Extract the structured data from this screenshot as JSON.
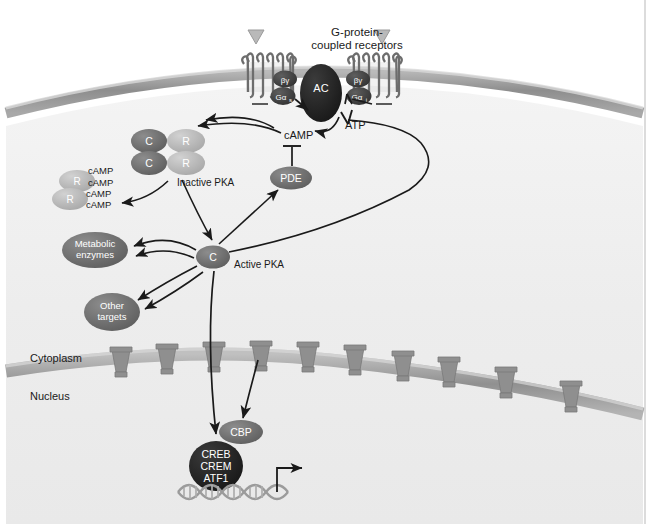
{
  "figure": {
    "background_color": "#ffffff",
    "cell_fill": "#efefef",
    "membrane_color": "#9a9a9a",
    "dark_protein_color": "#3d3d3d",
    "mid_protein_color": "#6f6f6f",
    "light_protein_color": "#b8b8b8",
    "line_color": "#1a1a1a",
    "text_color": "#1a1a1a",
    "label_on_dark_color": "#ffffff"
  },
  "header": {
    "receptor_title_line1": "G-protein-",
    "receptor_title_line2": "coupled receptors"
  },
  "ligands": [
    {
      "name": "ligand-left",
      "label": ""
    },
    {
      "name": "ligand-right",
      "label": ""
    }
  ],
  "receptors": [
    {
      "id": "receptor-left",
      "helix_count": 7,
      "g_protein": {
        "betagamma": "βγ",
        "alpha": "Gα",
        "alpha_sub": "s"
      }
    },
    {
      "id": "receptor-right",
      "helix_count": 7,
      "g_protein": {
        "betagamma": "βγ",
        "alpha": "Gα",
        "alpha_sub": "i"
      }
    }
  ],
  "enzymes": {
    "adenylyl_cyclase": {
      "label": "AC",
      "name": "adenylyl-cyclase"
    },
    "phosphodiesterase": {
      "label": "PDE",
      "name": "phosphodiesterase"
    }
  },
  "metabolites": {
    "atp": "ATP",
    "camp": "cAMP"
  },
  "pka": {
    "inactive_label": "Inactive PKA",
    "active_label": "Active PKA",
    "catalytic_subunit": "C",
    "regulatory_subunit": "R",
    "camp_bound_label": "cAMP",
    "camp_bound_count": 4
  },
  "targets": [
    {
      "id": "metabolic-enzymes",
      "line1": "Metabolic",
      "line2": "enzymes"
    },
    {
      "id": "other-targets",
      "line1": "Other",
      "line2": "targets"
    }
  ],
  "compartments": {
    "cytoplasm": "Cytoplasm",
    "nucleus": "Nucleus"
  },
  "nucleus": {
    "coactivator": {
      "label": "CBP",
      "name": "cbp-coactivator"
    },
    "transcription_factor": {
      "name": "creb-crem-atf1",
      "line1": "CREB",
      "line2": "CREM",
      "line3": "ATF1"
    },
    "dna": {
      "name": "dna-double-helix",
      "turns": 4
    },
    "transcription_arrow": {
      "name": "transcription-start-arrow"
    }
  },
  "nuclear_pores": {
    "count": 10
  },
  "interactions": [
    {
      "from": "receptor-left-galphas",
      "to": "adenylyl-cyclase",
      "type": "activation"
    },
    {
      "from": "receptor-right-galphai",
      "to": "adenylyl-cyclase",
      "type": "inhibition"
    },
    {
      "from": "adenylyl-cyclase",
      "to": "camp",
      "type": "conversion",
      "substrate": "ATP"
    },
    {
      "from": "camp",
      "to": "inactive-pka",
      "type": "activation"
    },
    {
      "from": "camp",
      "to": "regulatory-subunits",
      "type": "binding"
    },
    {
      "from": "phosphodiesterase",
      "to": "camp",
      "type": "inhibition"
    },
    {
      "from": "active-pka",
      "to": "phosphodiesterase",
      "type": "activation"
    },
    {
      "from": "active-pka",
      "to": "metabolic-enzymes",
      "type": "activation"
    },
    {
      "from": "active-pka",
      "to": "other-targets",
      "type": "activation"
    },
    {
      "from": "active-pka",
      "to": "adenylyl-cyclase",
      "type": "inhibition"
    },
    {
      "from": "active-pka",
      "to": "creb-crem-atf1",
      "type": "activation"
    },
    {
      "from": "active-pka",
      "to": "cbp-coactivator",
      "type": "activation"
    }
  ]
}
